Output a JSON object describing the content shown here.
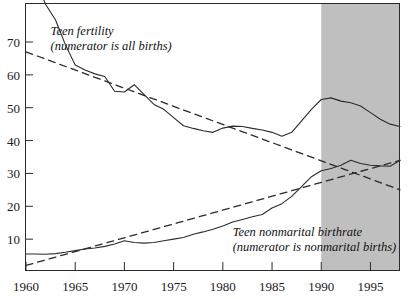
{
  "chart_data": {
    "type": "line",
    "title": "",
    "xlabel": "",
    "ylabel": "",
    "xlim": [
      1960,
      1998
    ],
    "ylim": [
      0,
      80
    ],
    "yticks": [
      10,
      20,
      30,
      40,
      50,
      60,
      70
    ],
    "xticks": [
      1960,
      1965,
      1970,
      1975,
      1980,
      1985,
      1990,
      1995
    ],
    "grid": false,
    "legend": "none",
    "shaded_region": {
      "label": "shaded-band",
      "x_start": 1990,
      "x_end": 1998,
      "color": "#bfbfbf"
    },
    "annotations": [
      {
        "name": "teen-fertility-label",
        "line1": "Teen fertility",
        "line2": "(numerator is all births)",
        "x": 1962.5,
        "y": 72
      },
      {
        "name": "teen-nonmarital-label",
        "line1": "Teen nonmarital birthrate",
        "line2": "(numerator is nonmarital births)",
        "x": 1981,
        "y": 11
      }
    ],
    "x": [
      1960,
      1961,
      1962,
      1963,
      1964,
      1965,
      1966,
      1967,
      1968,
      1969,
      1970,
      1971,
      1972,
      1973,
      1974,
      1975,
      1976,
      1977,
      1978,
      1979,
      1980,
      1981,
      1982,
      1983,
      1984,
      1985,
      1986,
      1987,
      1988,
      1989,
      1990,
      1991,
      1992,
      1993,
      1994,
      1995,
      1996,
      1997,
      1998
    ],
    "series": [
      {
        "name": "Teen fertility",
        "style": "solid",
        "color": "#2b2b2b",
        "values": [
          89.1,
          88.6,
          81.4,
          76.7,
          69.2,
          63.0,
          61.5,
          60.3,
          59.5,
          55.0,
          54.8,
          57.0,
          54.0,
          51.0,
          49.5,
          47.0,
          44.5,
          43.7,
          43.0,
          42.5,
          43.8,
          44.4,
          44.3,
          43.7,
          43.2,
          42.5,
          41.3,
          42.5,
          46.0,
          49.5,
          52.5,
          53.0,
          52.0,
          51.5,
          50.5,
          48.5,
          46.5,
          45.0,
          44.3
        ],
        "notes": "births per 1000 women aged 15-19, all births"
      },
      {
        "name": "Teen nonmarital birthrate",
        "style": "solid",
        "color": "#2b2b2b",
        "values": [
          5.5,
          5.5,
          5.4,
          5.6,
          6.0,
          6.5,
          7.0,
          7.3,
          7.8,
          8.5,
          9.5,
          9.0,
          8.8,
          9.0,
          9.5,
          10.0,
          10.5,
          11.5,
          12.2,
          13.0,
          14.0,
          15.2,
          16.0,
          16.8,
          17.5,
          19.5,
          20.8,
          23.0,
          26.0,
          29.0,
          30.8,
          31.5,
          32.5,
          34.0,
          33.0,
          32.5,
          32.3,
          32.2,
          34.0
        ],
        "notes": "nonmarital births per 1000 women aged 15-19"
      },
      {
        "name": "Teen fertility trend",
        "style": "dashed",
        "color": "#2b2b2b",
        "trend_endpoints": {
          "x0": 1960,
          "y0": 67.0,
          "x1": 1998,
          "y1": 25.0
        }
      },
      {
        "name": "Teen nonmarital trend",
        "style": "dashed",
        "color": "#2b2b2b",
        "trend_endpoints": {
          "x0": 1960,
          "y0": 2.0,
          "x1": 1998,
          "y1": 34.0
        }
      }
    ]
  },
  "axes": {
    "y_tick_labels": [
      "70",
      "60",
      "50",
      "40",
      "30",
      "20",
      "10"
    ],
    "x_tick_labels": [
      "1960",
      "1965",
      "1970",
      "1975",
      "1980",
      "1985",
      "1990",
      "1995"
    ]
  }
}
